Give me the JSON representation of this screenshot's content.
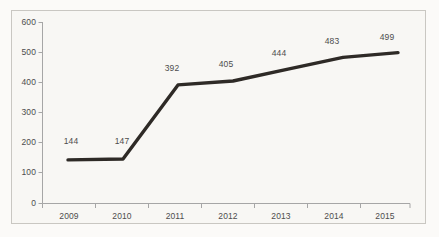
{
  "chart_data": {
    "type": "line",
    "title": "",
    "subtitle": "",
    "xlabel": "",
    "ylabel": "",
    "categories": [
      "2009",
      "2010",
      "2011",
      "2012",
      "2013",
      "2014",
      "2015"
    ],
    "values": [
      144,
      147,
      392,
      405,
      444,
      483,
      499
    ],
    "series": [
      {
        "name": "",
        "values": [
          144,
          147,
          392,
          405,
          444,
          483,
          499
        ]
      }
    ],
    "point_labels": [
      "144",
      "147",
      "392",
      "405",
      "444",
      "483",
      "499"
    ],
    "ylim": [
      0,
      600
    ],
    "ytick_labels": [
      "600",
      "500",
      "400",
      "300",
      "200",
      "100",
      "0"
    ],
    "ytick_values": [
      600,
      500,
      400,
      300,
      200,
      100,
      0
    ],
    "xtick_labels": [
      "2009",
      "2010",
      "2011",
      "2012",
      "2013",
      "2014",
      "2015"
    ],
    "grid": false,
    "legend": false,
    "legend_position": "none",
    "line_color": "#2e2a26",
    "axis_color": "#a6a6a6",
    "text_color": "#4d4d4d",
    "plot_background": "#f8f7f4",
    "border_color": "#c9c7c2"
  }
}
